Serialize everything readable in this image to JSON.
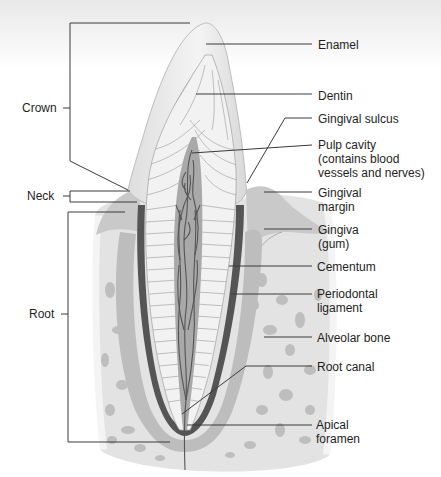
{
  "figure": {
    "colors": {
      "background": "#ffffff",
      "top_fade": "#ececec",
      "enamel": "#e9e9e9",
      "enamel_edge": "#bdbdbd",
      "dentin": "#f1f1f1",
      "dentin_lines": "#9a9a9a",
      "pulp": "#a9a9a9",
      "vessels": "#5a5a5a",
      "cementum": "#555555",
      "periodontal_ligament": "#bcbcbc",
      "gingiva": "#c8c8c8",
      "alveolar_bone": "#e6e6e6",
      "bone_holes": "#b9b9b9",
      "leader_line": "#3a3a3a",
      "text": "#1e1e1e"
    }
  },
  "left_labels": {
    "crown": "Crown",
    "neck": "Neck",
    "root": "Root"
  },
  "right_labels": {
    "enamel": [
      "Enamel"
    ],
    "dentin": [
      "Dentin"
    ],
    "gingival_sulcus": [
      "Gingival sulcus"
    ],
    "pulp_cavity": [
      "Pulp cavity",
      "(contains blood",
      "vessels and nerves)"
    ],
    "gingival_margin": [
      "Gingival",
      "margin"
    ],
    "gingiva": [
      "Gingiva",
      "(gum)"
    ],
    "cementum": [
      "Cementum"
    ],
    "periodontal_ligament": [
      "Periodontal",
      "ligament"
    ],
    "alveolar_bone": [
      "Alveolar bone"
    ],
    "root_canal": [
      "Root canal"
    ],
    "apical_foramen": [
      "Apical",
      "foramen"
    ]
  }
}
